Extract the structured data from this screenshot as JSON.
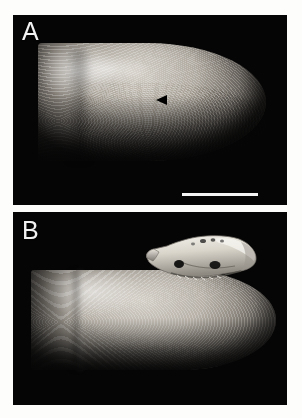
{
  "figure": {
    "background_color": "#fdfdfb",
    "panel_background_color": "#050505",
    "panels": [
      {
        "id": "A",
        "label": "A",
        "subject": "human-fingertip",
        "annotations": [
          {
            "type": "arrowhead",
            "color": "#000000",
            "direction": "left",
            "x": 148,
            "y": 85
          },
          {
            "type": "scale-bar",
            "color": "#f4f4f4",
            "length_px": 76,
            "x": 182,
            "y": 180
          }
        ]
      },
      {
        "id": "B",
        "label": "B",
        "subject": "human-fingertip-with-mammal-skull",
        "annotations": []
      }
    ]
  }
}
